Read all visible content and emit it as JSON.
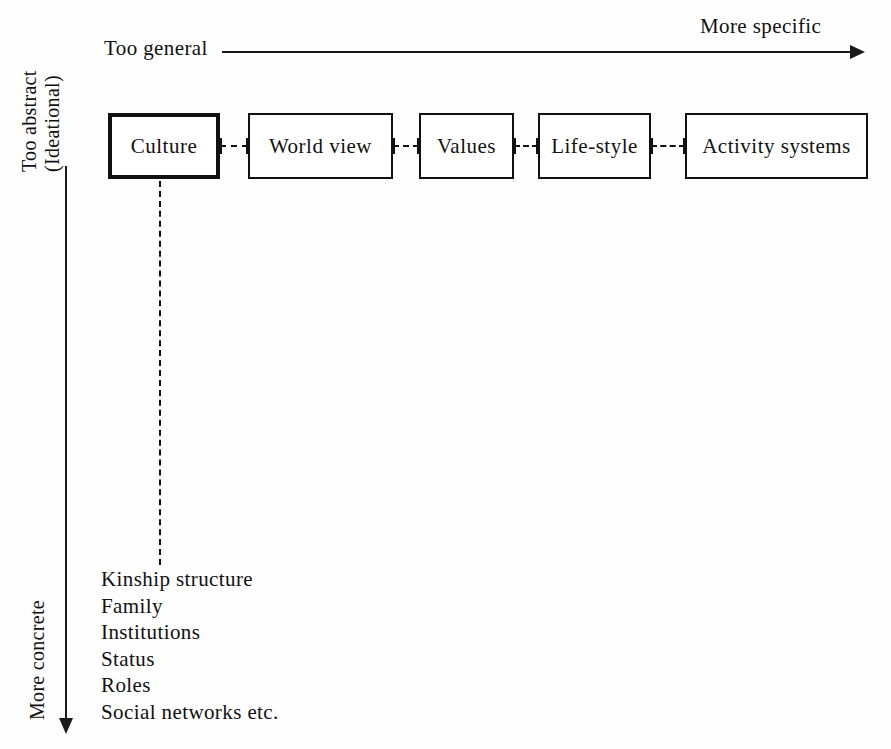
{
  "diagram": {
    "colors": {
      "background": "#fefefe",
      "ink": "#111111",
      "line": "#1a1a1a"
    },
    "horizontal_axis": {
      "start_label": "Too general",
      "end_label": "More specific",
      "direction": "left-to-right"
    },
    "vertical_axis": {
      "top_label_line1": "Too abstract",
      "top_label_line2": "(Ideational)",
      "bottom_label": "More concrete",
      "direction": "top-to-bottom"
    },
    "boxes": [
      {
        "label": "Culture",
        "emphasis": true,
        "x": 108,
        "width": 112
      },
      {
        "label": "World view",
        "emphasis": false,
        "x": 248,
        "width": 145
      },
      {
        "label": "Values",
        "emphasis": false,
        "x": 419,
        "width": 95
      },
      {
        "label": "Life-style",
        "emphasis": false,
        "x": 538,
        "width": 113
      },
      {
        "label": "Activity systems",
        "emphasis": false,
        "x": 685,
        "width": 183
      }
    ],
    "connectors": [
      {
        "from": "Culture",
        "to": "World view",
        "x": 220,
        "width": 28
      },
      {
        "from": "World view",
        "to": "Values",
        "x": 393,
        "width": 26
      },
      {
        "from": "Values",
        "to": "Life-style",
        "x": 514,
        "width": 24
      },
      {
        "from": "Life-style",
        "to": "Activity systems",
        "x": 651,
        "width": 34
      }
    ],
    "detail_list": {
      "source_box": "Culture",
      "items": [
        "Kinship structure",
        "Family",
        "Institutions",
        "Status",
        "Roles",
        "Social networks etc."
      ]
    }
  }
}
